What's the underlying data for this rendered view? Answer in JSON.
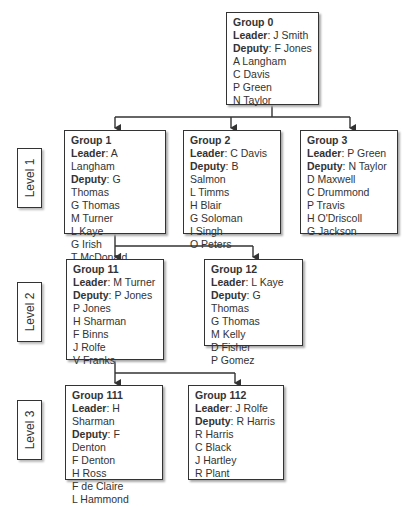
{
  "levels": [
    "Level 1",
    "Level 2",
    "Level 3"
  ],
  "labels": {
    "leader": "Leader",
    "deputy": "Deputy",
    "sep": ": "
  },
  "groups": {
    "g0": {
      "title": "Group 0",
      "leader": "J Smith",
      "deputy": "F Jones",
      "members": [
        "A Langham",
        "C Davis",
        "P Green",
        "N Taylor"
      ]
    },
    "g1": {
      "title": "Group 1",
      "leader": "A Langham",
      "deputy": "G Thomas",
      "members": [
        "G Thomas",
        "M Turner",
        "L Kaye",
        "G Irish",
        "T McDonald"
      ]
    },
    "g2": {
      "title": "Group 2",
      "leader": "C Davis",
      "deputy": "B Salmon",
      "members": [
        "L Timms",
        "H Blair",
        "G Soloman",
        "I Singh",
        "O Peters"
      ]
    },
    "g3": {
      "title": "Group 3",
      "leader": "P Green",
      "deputy": "N Taylor",
      "members": [
        "D Maxwell",
        "C Drummond",
        "P Travis",
        "H O'Driscoll",
        "G Jackson"
      ]
    },
    "g11": {
      "title": "Group 11",
      "leader": "M Turner",
      "deputy": "P Jones",
      "members": [
        "P Jones",
        "H Sharman",
        "F Binns",
        "J Rolfe",
        "V Franks"
      ]
    },
    "g12": {
      "title": "Group 12",
      "leader": "L Kaye",
      "deputy": "G Thomas",
      "members": [
        "G Thomas",
        "M Kelly",
        "D Fisher",
        "P Gomez"
      ]
    },
    "g111": {
      "title": "Group 111",
      "leader": "H Sharman",
      "deputy": "F Denton",
      "members": [
        "F Denton",
        "H Ross",
        "F de Claire",
        "L Hammond"
      ]
    },
    "g112": {
      "title": "Group 112",
      "leader": "J Rolfe",
      "deputy": "R Harris",
      "members": [
        "R Harris",
        "C Black",
        "J Hartley",
        "R Plant"
      ]
    }
  },
  "colors": {
    "line": "#333333",
    "shadow": "#aaaaaa",
    "background": "#ffffff"
  }
}
